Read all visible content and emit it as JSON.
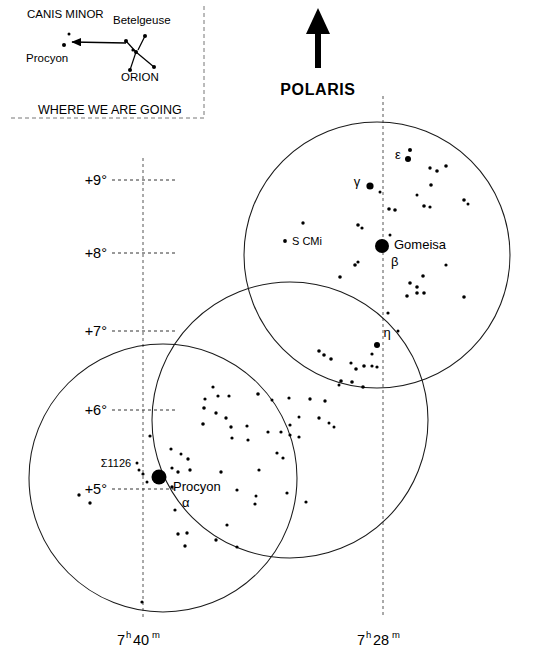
{
  "figure": {
    "background_color": "#ffffff",
    "ink_color": "#000000"
  },
  "polaris": {
    "label": "POLARIS",
    "arrow_direction": "up",
    "arrow_name": "north-arrow"
  },
  "inset": {
    "caption": "WHERE WE ARE GOING",
    "labels": [
      {
        "text": "CANIS MINOR",
        "x": 27,
        "y": 18
      },
      {
        "text": "Procyon",
        "x": 26,
        "y": 62
      },
      {
        "text": "Betelgeuse",
        "x": 113,
        "y": 24
      },
      {
        "text": "ORION",
        "x": 121,
        "y": 81
      }
    ],
    "stars": [
      {
        "x": 64,
        "y": 45,
        "r": 2.0
      },
      {
        "x": 69,
        "y": 34,
        "r": 1.5
      },
      {
        "x": 126,
        "y": 41,
        "r": 2.0
      },
      {
        "x": 145,
        "y": 36,
        "r": 2.0
      },
      {
        "x": 136,
        "y": 52,
        "r": 2.0
      },
      {
        "x": 133,
        "y": 50,
        "r": 1.6
      },
      {
        "x": 130,
        "y": 70,
        "r": 2.0
      },
      {
        "x": 154,
        "y": 67,
        "r": 2.0
      }
    ],
    "constellation_lines": [
      [
        126,
        41,
        136,
        52
      ],
      [
        145,
        36,
        138,
        50
      ],
      [
        136,
        52,
        130,
        70
      ],
      [
        136,
        52,
        154,
        67
      ]
    ],
    "arrow": {
      "from_x": 126,
      "from_y": 43,
      "to_x": 72,
      "to_y": 42
    },
    "border": {
      "x": 8,
      "y": 6,
      "w": 196,
      "h": 112
    }
  },
  "axes": {
    "declination_label_name": "declination-axis",
    "right_ascension_label_name": "right-ascension-axis",
    "declination_ticks": [
      {
        "label": "+9°",
        "y": 180
      },
      {
        "label": "+8°",
        "y": 253
      },
      {
        "label": "+7°",
        "y": 331
      },
      {
        "label": "+6°",
        "y": 410
      },
      {
        "label": "+5°",
        "y": 489
      }
    ],
    "right_ascension_ticks": [
      {
        "hours": "7",
        "h_sup": "h",
        "minutes": "40",
        "m_sup": "m",
        "x": 143
      },
      {
        "hours": "7",
        "h_sup": "h",
        "minutes": "28",
        "m_sup": "m",
        "x": 383
      }
    ],
    "grid_vertical_lines": [
      {
        "x": 143,
        "y1": 158,
        "y2": 618
      },
      {
        "x": 383,
        "y1": 96,
        "y2": 618
      }
    ]
  },
  "fields_of_view": [
    {
      "name": "field-of-view-north",
      "cx": 377,
      "cy": 255,
      "r": 133
    },
    {
      "name": "field-of-view-middle",
      "cx": 290,
      "cy": 420,
      "r": 138
    },
    {
      "name": "field-of-view-southwest",
      "cx": 163,
      "cy": 478,
      "r": 134
    }
  ],
  "chart_data": {
    "type": "scatter",
    "xlabel": "Right Ascension",
    "ylabel": "Declination",
    "grid": true,
    "legend_position": "none",
    "x_tick_labels": [
      "7h 40m",
      "7h 28m"
    ],
    "y_tick_labels": [
      "+9°",
      "+8°",
      "+7°",
      "+6°",
      "+5°"
    ],
    "named_stars": [
      {
        "name": "Gomeisa",
        "bayer": "β",
        "x": 382,
        "y": 246,
        "r": 7.0,
        "label_dx": 12,
        "label_dy": 3,
        "bayer_dx": 9,
        "bayer_dy": 20
      },
      {
        "name": "Procyon",
        "bayer": "α",
        "x": 159,
        "y": 477,
        "r": 7.5,
        "label_dx": 14,
        "label_dy": 14,
        "bayer_dx": 23,
        "bayer_dy": 30
      },
      {
        "name": "S CMi",
        "bayer": "",
        "x": 285,
        "y": 241,
        "r": 1.9,
        "label_dx": 7,
        "label_dy": 4,
        "bayer_dx": 0,
        "bayer_dy": 0
      },
      {
        "name": "Σ1126",
        "bayer": "",
        "x": 116,
        "y": 467,
        "r": 0,
        "label_dx": 0,
        "label_dy": 0,
        "bayer_dx": 0,
        "bayer_dy": 0
      }
    ],
    "greek_labels": [
      {
        "text": "ε",
        "x": 398,
        "y": 159,
        "star_x": 408,
        "star_y": 159,
        "star_r": 3.0
      },
      {
        "text": "γ",
        "x": 357,
        "y": 186,
        "star_x": 370,
        "star_y": 186,
        "star_r": 3.6
      },
      {
        "text": "η",
        "x": 387,
        "y": 337,
        "star_x": 377,
        "star_y": 345,
        "star_r": 3.0
      }
    ],
    "field_stars": [
      {
        "x": 410,
        "y": 150,
        "r": 2.0
      },
      {
        "x": 430,
        "y": 168,
        "r": 1.7
      },
      {
        "x": 437,
        "y": 171,
        "r": 1.8
      },
      {
        "x": 446,
        "y": 166,
        "r": 1.8
      },
      {
        "x": 380,
        "y": 192,
        "r": 1.5
      },
      {
        "x": 431,
        "y": 185,
        "r": 1.8
      },
      {
        "x": 424,
        "y": 206,
        "r": 1.8
      },
      {
        "x": 430,
        "y": 207,
        "r": 1.6
      },
      {
        "x": 417,
        "y": 195,
        "r": 1.5
      },
      {
        "x": 464,
        "y": 200,
        "r": 1.8
      },
      {
        "x": 468,
        "y": 204,
        "r": 1.5
      },
      {
        "x": 389,
        "y": 209,
        "r": 1.8
      },
      {
        "x": 395,
        "y": 210,
        "r": 1.8
      },
      {
        "x": 303,
        "y": 223,
        "r": 1.7
      },
      {
        "x": 358,
        "y": 225,
        "r": 1.8
      },
      {
        "x": 362,
        "y": 228,
        "r": 1.6
      },
      {
        "x": 390,
        "y": 235,
        "r": 1.5
      },
      {
        "x": 355,
        "y": 265,
        "r": 1.8
      },
      {
        "x": 358,
        "y": 262,
        "r": 1.6
      },
      {
        "x": 340,
        "y": 277,
        "r": 1.8
      },
      {
        "x": 446,
        "y": 265,
        "r": 1.6
      },
      {
        "x": 423,
        "y": 276,
        "r": 1.8
      },
      {
        "x": 410,
        "y": 283,
        "r": 1.8
      },
      {
        "x": 417,
        "y": 287,
        "r": 1.8
      },
      {
        "x": 407,
        "y": 296,
        "r": 1.8
      },
      {
        "x": 417,
        "y": 293,
        "r": 1.8
      },
      {
        "x": 424,
        "y": 293,
        "r": 1.8
      },
      {
        "x": 464,
        "y": 297,
        "r": 1.8
      },
      {
        "x": 319,
        "y": 351,
        "r": 1.8
      },
      {
        "x": 324,
        "y": 355,
        "r": 1.8
      },
      {
        "x": 331,
        "y": 359,
        "r": 1.8
      },
      {
        "x": 351,
        "y": 363,
        "r": 1.6
      },
      {
        "x": 356,
        "y": 369,
        "r": 1.8
      },
      {
        "x": 364,
        "y": 366,
        "r": 1.8
      },
      {
        "x": 372,
        "y": 354,
        "r": 1.6
      },
      {
        "x": 372,
        "y": 366,
        "r": 1.6
      },
      {
        "x": 341,
        "y": 381,
        "r": 1.8
      },
      {
        "x": 352,
        "y": 382,
        "r": 1.8
      },
      {
        "x": 363,
        "y": 387,
        "r": 1.8
      },
      {
        "x": 218,
        "y": 396,
        "r": 1.6
      },
      {
        "x": 205,
        "y": 399,
        "r": 1.6
      },
      {
        "x": 229,
        "y": 396,
        "r": 1.6
      },
      {
        "x": 213,
        "y": 387,
        "r": 1.6
      },
      {
        "x": 258,
        "y": 394,
        "r": 1.8
      },
      {
        "x": 272,
        "y": 400,
        "r": 1.5
      },
      {
        "x": 289,
        "y": 398,
        "r": 1.6
      },
      {
        "x": 310,
        "y": 399,
        "r": 1.7
      },
      {
        "x": 325,
        "y": 401,
        "r": 1.7
      },
      {
        "x": 204,
        "y": 408,
        "r": 1.8
      },
      {
        "x": 216,
        "y": 413,
        "r": 1.7
      },
      {
        "x": 226,
        "y": 418,
        "r": 1.7
      },
      {
        "x": 203,
        "y": 424,
        "r": 1.8
      },
      {
        "x": 231,
        "y": 427,
        "r": 1.7
      },
      {
        "x": 247,
        "y": 426,
        "r": 1.6
      },
      {
        "x": 268,
        "y": 432,
        "r": 1.6
      },
      {
        "x": 290,
        "y": 425,
        "r": 1.6
      },
      {
        "x": 299,
        "y": 417,
        "r": 1.5
      },
      {
        "x": 319,
        "y": 418,
        "r": 1.7
      },
      {
        "x": 329,
        "y": 423,
        "r": 1.5
      },
      {
        "x": 334,
        "y": 427,
        "r": 1.5
      },
      {
        "x": 281,
        "y": 432,
        "r": 1.6
      },
      {
        "x": 290,
        "y": 435,
        "r": 1.6
      },
      {
        "x": 299,
        "y": 437,
        "r": 1.6
      },
      {
        "x": 232,
        "y": 438,
        "r": 1.6
      },
      {
        "x": 248,
        "y": 440,
        "r": 1.6
      },
      {
        "x": 277,
        "y": 453,
        "r": 1.6
      },
      {
        "x": 283,
        "y": 458,
        "r": 1.6
      },
      {
        "x": 150,
        "y": 436,
        "r": 1.6
      },
      {
        "x": 171,
        "y": 449,
        "r": 1.6
      },
      {
        "x": 181,
        "y": 454,
        "r": 1.5
      },
      {
        "x": 188,
        "y": 459,
        "r": 1.7
      },
      {
        "x": 137,
        "y": 463,
        "r": 1.5
      },
      {
        "x": 143,
        "y": 474,
        "r": 1.6
      },
      {
        "x": 139,
        "y": 470,
        "r": 1.5
      },
      {
        "x": 147,
        "y": 482,
        "r": 1.5
      },
      {
        "x": 172,
        "y": 468,
        "r": 1.6
      },
      {
        "x": 178,
        "y": 472,
        "r": 1.7
      },
      {
        "x": 190,
        "y": 470,
        "r": 1.7
      },
      {
        "x": 172,
        "y": 487,
        "r": 1.7
      },
      {
        "x": 221,
        "y": 472,
        "r": 1.7
      },
      {
        "x": 237,
        "y": 490,
        "r": 1.6
      },
      {
        "x": 259,
        "y": 470,
        "r": 1.6
      },
      {
        "x": 287,
        "y": 493,
        "r": 1.6
      },
      {
        "x": 306,
        "y": 502,
        "r": 1.6
      },
      {
        "x": 255,
        "y": 504,
        "r": 1.6
      },
      {
        "x": 256,
        "y": 496,
        "r": 1.5
      },
      {
        "x": 79,
        "y": 495,
        "r": 1.7
      },
      {
        "x": 90,
        "y": 503,
        "r": 1.7
      },
      {
        "x": 175,
        "y": 510,
        "r": 1.6
      },
      {
        "x": 178,
        "y": 534,
        "r": 1.7
      },
      {
        "x": 187,
        "y": 533,
        "r": 1.7
      },
      {
        "x": 185,
        "y": 546,
        "r": 1.7
      },
      {
        "x": 216,
        "y": 540,
        "r": 1.7
      },
      {
        "x": 227,
        "y": 525,
        "r": 1.6
      },
      {
        "x": 237,
        "y": 547,
        "r": 1.6
      },
      {
        "x": 142,
        "y": 602,
        "r": 1.6
      },
      {
        "x": 398,
        "y": 331,
        "r": 1.5
      },
      {
        "x": 388,
        "y": 313,
        "r": 1.6
      },
      {
        "x": 377,
        "y": 367,
        "r": 1.6
      },
      {
        "x": 339,
        "y": 385,
        "r": 1.5
      }
    ]
  }
}
